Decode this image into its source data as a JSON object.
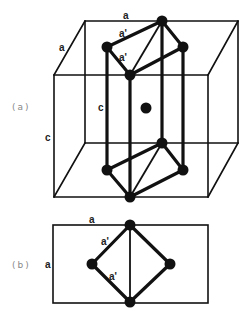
{
  "figure": {
    "panel_a": {
      "label": "(a)",
      "edge_labels": {
        "top_a": "a",
        "side_a": "a",
        "upper_a_prime": "a'",
        "lower_a_prime": "a'",
        "inner_c": "c",
        "outer_c": "c"
      }
    },
    "panel_b": {
      "label": "(b)",
      "edge_labels": {
        "top_a": "a",
        "side_a": "a",
        "upper_a_prime": "a'",
        "lower_a_prime": "a'"
      }
    },
    "colors": {
      "line": "#111111",
      "atom": "#111111",
      "panel_label": "#888888",
      "background": "#ffffff"
    }
  }
}
